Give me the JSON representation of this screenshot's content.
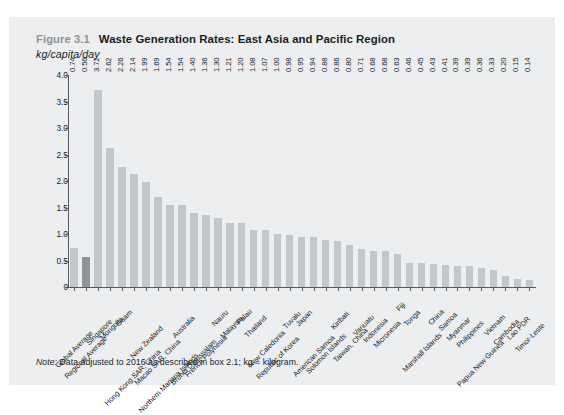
{
  "figure": {
    "number": "Figure 3.1",
    "title": "Waste Generation Rates: East Asia and Pacific Region",
    "subtitle": "kg/capita/day",
    "note_label": "Note:",
    "note_text": "Data adjusted to 2016 as described in box 2.1; kg = kilogram."
  },
  "colors": {
    "page_background": "#eceeef",
    "bar": "#c3c7c9",
    "bar_highlight": "#8f9498",
    "axis": "#55595c",
    "text": "#1a1d1f",
    "figure_number": "#8d9295"
  },
  "chart_data": {
    "type": "bar",
    "title": "Waste Generation Rates: East Asia and Pacific Region",
    "xlabel": "",
    "ylabel": "kg/capita/day",
    "ylim": [
      0,
      4.0
    ],
    "yticks": [
      "0",
      "0.5",
      "1.0",
      "1.5",
      "2.0",
      "2.5",
      "3.0",
      "3.5",
      "4.0"
    ],
    "ytick_values": [
      0,
      0.5,
      1.0,
      1.5,
      2.0,
      2.5,
      3.0,
      3.5,
      4.0
    ],
    "grid": false,
    "legend": "none",
    "value_labels": true,
    "highlight_category": "Regional Average",
    "categories": [
      "Global Average",
      "Regional Average",
      "Singapore",
      "Mongolia",
      "Guam",
      "Hong Kong SAR, China",
      "New Zealand",
      "Macao SAR, China",
      "Northern Mariana Islands",
      "Australia",
      "Brunei Darussalam",
      "French Polynesia",
      "Nauru",
      "Malaysia",
      "Palau",
      "Thailand",
      "New Caledonia",
      "Republic of Korea",
      "Tuvalu",
      "Japan",
      "American Samoa",
      "Solomon Islands",
      "Kiribati",
      "Taiwan, China",
      "Vanuatu",
      "Indonesia",
      "Micronesia",
      "Fiji",
      "Tonga",
      "Marshall Islands",
      "China",
      "Samoa",
      "Myanmar",
      "Philippines",
      "Papua New Guinea",
      "Vietnam",
      "Cambodia",
      "Lao PDR",
      "Timor-Leste"
    ],
    "values": [
      0.74,
      0.56,
      3.72,
      2.62,
      2.26,
      2.14,
      1.99,
      1.69,
      1.54,
      1.54,
      1.4,
      1.36,
      1.3,
      1.21,
      1.2,
      1.08,
      1.07,
      1.0,
      0.98,
      0.95,
      0.94,
      0.88,
      0.86,
      0.8,
      0.71,
      0.68,
      0.68,
      0.63,
      0.46,
      0.45,
      0.43,
      0.41,
      0.39,
      0.39,
      0.36,
      0.33,
      0.2,
      0.15,
      0.14
    ],
    "value_label_text": [
      "0.74",
      "0.56",
      "3.72",
      "2.62",
      "2.26",
      "2.14",
      "1.99",
      "1.69",
      "1.54",
      "1.54",
      "1.40",
      "1.36",
      "1.30",
      "1.21",
      "1.20",
      "1.08",
      "1.07",
      "1.00",
      "0.98",
      "0.95",
      "0.94",
      "0.88",
      "0.86",
      "0.80",
      "0.71",
      "0.68",
      "0.68",
      "0.63",
      "0.46",
      "0.45",
      "0.43",
      "0.41",
      "0.39",
      "0.39",
      "0.36",
      "0.33",
      "0.20",
      "0.15",
      "0.14"
    ]
  }
}
